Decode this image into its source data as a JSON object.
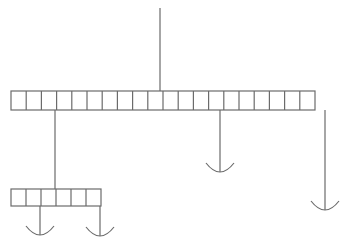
{
  "diagram": {
    "type": "hanging-mobile",
    "stroke_color": "#6b6b6b",
    "background": "#ffffff",
    "top_string": {
      "x": 160,
      "y1": 8,
      "y2": 91
    },
    "top_bar": {
      "x": 11,
      "y": 91,
      "cell_width": 15.2,
      "cell_height": 19,
      "cells": 20
    },
    "middle_hanger": {
      "x": 220,
      "y1": 110,
      "y2": 172,
      "arc_half_width": 14,
      "arc_depth": 9
    },
    "right_hanger": {
      "x": 325,
      "y1": 110,
      "y2": 210,
      "arc_half_width": 14,
      "arc_depth": 9
    },
    "connector": {
      "x": 55,
      "y1": 110,
      "y2": 189
    },
    "bottom_bar": {
      "x": 11,
      "y": 189,
      "cell_width": 15,
      "cell_height": 17,
      "cells": 6
    },
    "bottom_left_hanger": {
      "x": 40,
      "y1": 206,
      "y2": 235,
      "arc_half_width": 14,
      "arc_depth": 9
    },
    "bottom_right_hanger": {
      "x": 100,
      "y1": 206,
      "y2": 236,
      "arc_half_width": 14,
      "arc_depth": 9
    }
  }
}
